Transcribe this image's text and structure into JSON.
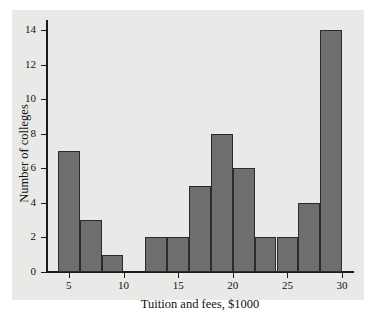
{
  "chart_data": {
    "type": "bar",
    "title": "",
    "subtitle": "",
    "xlabel": "Tuition and fees, $1000",
    "ylabel": "Number of colleges",
    "bin_width": 2,
    "bin_edges": [
      4,
      6,
      8,
      10,
      12,
      14,
      16,
      18,
      20,
      22,
      24,
      26,
      28,
      30
    ],
    "categories": [
      "4-6",
      "6-8",
      "8-10",
      "10-12",
      "12-14",
      "14-16",
      "16-18",
      "18-20",
      "20-22",
      "22-24",
      "24-26",
      "26-28",
      "28-30"
    ],
    "values": [
      7,
      3,
      1,
      0,
      2,
      2,
      5,
      8,
      6,
      2,
      2,
      4,
      14
    ],
    "x": [
      5,
      7,
      9,
      11,
      13,
      15,
      17,
      19,
      21,
      23,
      25,
      27,
      29
    ],
    "xlim": [
      3,
      31
    ],
    "ylim": [
      0,
      14.6
    ],
    "xticks": [
      5,
      10,
      15,
      20,
      25,
      30
    ],
    "yticks": [
      0,
      2,
      4,
      6,
      8,
      10,
      12,
      14
    ],
    "xtick_labels": [
      "5",
      "10",
      "15",
      "20",
      "25",
      "30"
    ],
    "ytick_labels": [
      "0",
      "2",
      "4",
      "6",
      "8",
      "10",
      "12",
      "14"
    ],
    "grid": false,
    "legend": null,
    "bar_color": "#6e6e6e",
    "bar_edge_color": "#2b2b2b",
    "plot_background": "#e9e9e7",
    "axis_color": "#1a1a1a",
    "text_color": "#111111"
  }
}
